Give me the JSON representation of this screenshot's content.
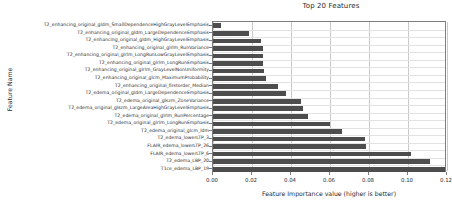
{
  "chart_data": {
    "type": "bar",
    "orientation": "horizontal",
    "title": "Top 20 Features",
    "xlabel": "Feature Importance value (higher is better)",
    "ylabel": "Feature Name",
    "xlim": [
      0.0,
      0.12
    ],
    "xticks": [
      0.0,
      0.02,
      0.04,
      0.06,
      0.08,
      0.1,
      0.12
    ],
    "xticklabels": [
      "0.00",
      "0.02",
      "0.04",
      "0.06",
      "0.08",
      "0.10",
      "0.12"
    ],
    "grid": true,
    "legend": null,
    "bar_color": "#4d4d4d",
    "categories": [
      "T2_enhancing_original_gldm_SmallDependenceHighGrayLevelEmphasis",
      "T2_enhancing_original_gldm_LargeDependenceEmphasis",
      "T2_enhancing_original_gldm_HighGrayLevelEmphasis",
      "T2_enhancing_original_glrlm_RunVariance",
      "T2_enhancing_original_glrlm_LongRunLowGrayLevelEmphasis",
      "T2_enhancing_original_glrlm_LongRunEmphasis",
      "T2_enhancing_original_glrlm_GrayLevelNonUniformity",
      "T2_enhancing_original_glcm_MaximumProbability",
      "T2_enhancing_original_firstorder_Median",
      "T2_edema_original_gldm_LargeDependenceEmphasis",
      "T2_edema_original_glszm_ZoneVariance",
      "T2_edema_original_glszm_LargeAreaHighGrayLevelEmphasis",
      "T2_edema_original_glrlm_RunPercentage",
      "T2_edema_original_glrlm_LongRunEmphasis",
      "T2_edema_original_glcm_Idm",
      "T2_edema_lowerLTP_3",
      "FLAIR_edema_lowerLTP_26",
      "FLAIR_edema_lowerLTP_6",
      "T2_edema_LBP_20",
      "T1ce_edema_LBP_19"
    ],
    "values": [
      0.004,
      0.0185,
      0.0245,
      0.0255,
      0.0257,
      0.0258,
      0.0262,
      0.0272,
      0.0335,
      0.0375,
      0.045,
      0.046,
      0.0487,
      0.06,
      0.0663,
      0.078,
      0.0783,
      0.1015,
      0.1115,
      0.119
    ]
  }
}
